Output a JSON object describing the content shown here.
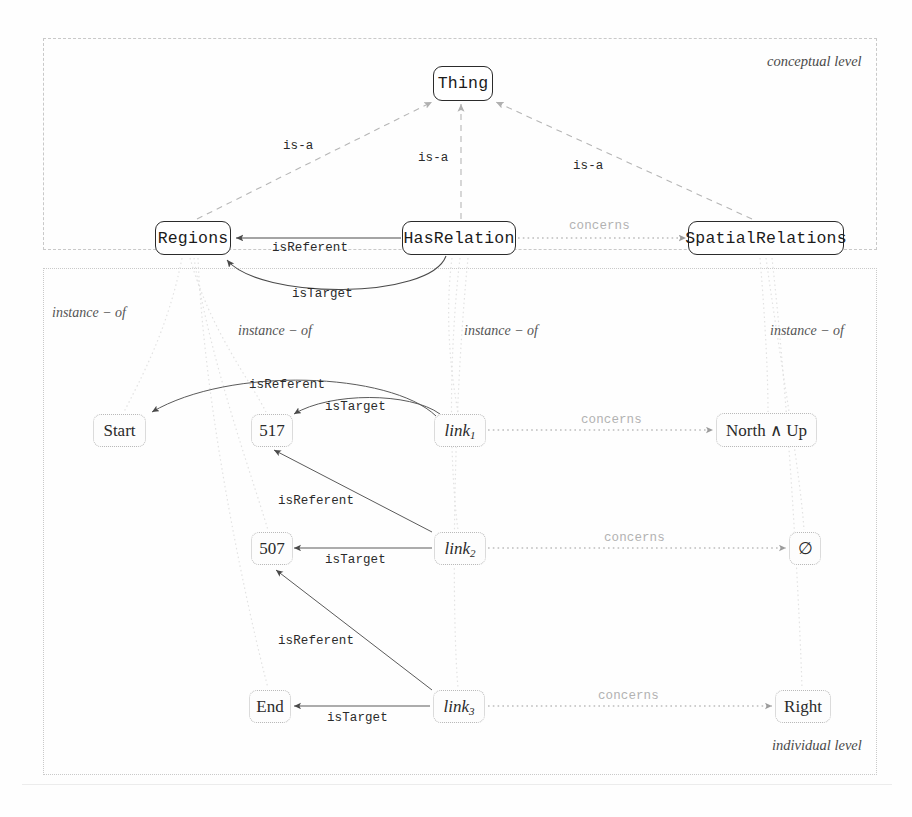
{
  "diagram": {
    "levels": [
      {
        "id": "conceptual",
        "label": "conceptual level"
      },
      {
        "id": "individual",
        "label": "individual level"
      }
    ],
    "conceptual_nodes": [
      {
        "id": "thing",
        "label": "Thing"
      },
      {
        "id": "regions",
        "label": "Regions"
      },
      {
        "id": "hasrelation",
        "label": "HasRelation"
      },
      {
        "id": "spatialrelations",
        "label": "SpatialRelations"
      }
    ],
    "individual_nodes": [
      {
        "id": "start",
        "label": "Start"
      },
      {
        "id": "r517",
        "label": "517"
      },
      {
        "id": "link1",
        "label": "link",
        "sub": "1"
      },
      {
        "id": "northup",
        "label": "North ∧ Up"
      },
      {
        "id": "r507",
        "label": "507"
      },
      {
        "id": "link2",
        "label": "link",
        "sub": "2"
      },
      {
        "id": "emptyset",
        "label": "∅"
      },
      {
        "id": "end",
        "label": "End"
      },
      {
        "id": "link3",
        "label": "link",
        "sub": "3"
      },
      {
        "id": "right",
        "label": "Right"
      }
    ],
    "edge_labels": {
      "is_a_left": "is-a",
      "is_a_middle": "is-a",
      "is_a_right": "is-a",
      "is_referent_concept": "isReferent",
      "concerns_concept": "concerns",
      "is_target_concept": "isTarget",
      "is_referent_1": "isReferent",
      "is_target_1": "isTarget",
      "concerns_1": "concerns",
      "is_referent_2": "isReferent",
      "is_target_2": "isTarget",
      "concerns_2": "concerns",
      "is_referent_3": "isReferent",
      "is_target_3": "isTarget",
      "concerns_3": "concerns"
    },
    "instance_of_labels": [
      {
        "id": "instance-of-1",
        "label": "instance − of"
      },
      {
        "id": "instance-of-2",
        "label": "instance − of"
      },
      {
        "id": "instance-of-3",
        "label": "instance − of"
      },
      {
        "id": "instance-of-4",
        "label": "instance − of"
      }
    ],
    "colors": {
      "node_stroke": "#2b2b2b",
      "instance_stroke": "#b9b9b9",
      "edge_solid": "#4a4a4a",
      "edge_dashed": "#b6b6b6",
      "edge_dotted": "#c9c9c9",
      "container_border": "#c9c9c9",
      "text": "#1b1b1b"
    }
  }
}
